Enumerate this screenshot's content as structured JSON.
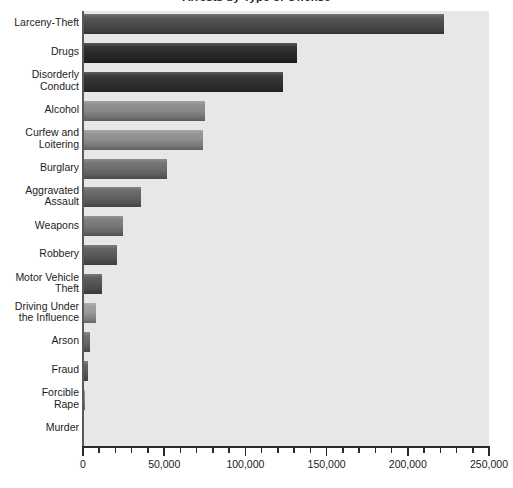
{
  "chart_data": {
    "type": "bar",
    "orientation": "horizontal",
    "title": "Arrests by Type of Offense",
    "xlabel": "",
    "ylabel": "",
    "xlim": [
      0,
      250000
    ],
    "xticks": [
      0,
      50000,
      100000,
      150000,
      200000,
      250000
    ],
    "xticklabels": [
      "0",
      "50,000",
      "100,000",
      "150,000",
      "200,000",
      "250,000"
    ],
    "minor_tick_interval": 10000,
    "grid": false,
    "legend": "none",
    "categories": [
      "Larceny-Theft",
      "Drugs",
      "Disorderly Conduct",
      "Alcohol",
      "Curfew and Loitering",
      "Burglary",
      "Aggravated Assault",
      "Weapons",
      "Robbery",
      "Motor Vehicle Theft",
      "Driving Under the Influence",
      "Arson",
      "Fraud",
      "Forcible Rape",
      "Murder"
    ],
    "values": [
      222000,
      132000,
      123000,
      75000,
      74000,
      52000,
      35500,
      24500,
      21000,
      11500,
      8000,
      4300,
      3000,
      1200,
      300
    ],
    "bar_colors": [
      "#4d4d4d",
      "#2b2b2b",
      "#313131",
      "#8a8a8a",
      "#8f8f8f",
      "#6e6e6e",
      "#646464",
      "#787878",
      "#5b5b5b",
      "#555555",
      "#9a9a9a",
      "#6a6a6a",
      "#5c5c5c",
      "#8c8c8c",
      "#7a7a7a"
    ]
  },
  "axis": {
    "plot_background": "#e7e7e7",
    "axis_color": "#2a2a2a"
  },
  "labels": {
    "lines": [
      [
        "Larceny-Theft"
      ],
      [
        "Drugs"
      ],
      [
        "Disorderly",
        "Conduct"
      ],
      [
        "Alcohol"
      ],
      [
        "Curfew and",
        "Loitering"
      ],
      [
        "Burglary"
      ],
      [
        "Aggravated",
        "Assault"
      ],
      [
        "Weapons"
      ],
      [
        "Robbery"
      ],
      [
        "Motor Vehicle",
        "Theft"
      ],
      [
        "Driving Under",
        "the Influence"
      ],
      [
        "Arson"
      ],
      [
        "Fraud"
      ],
      [
        "Forcible",
        "Rape"
      ],
      [
        "Murder"
      ]
    ]
  }
}
